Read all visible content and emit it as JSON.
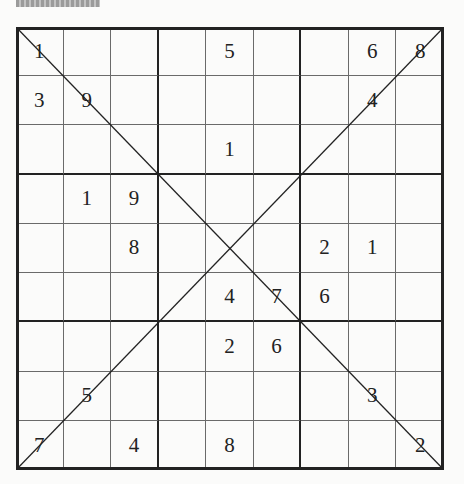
{
  "header": {
    "text": ""
  },
  "puzzle": {
    "type": "diagonal-sudoku",
    "size": 9,
    "grid": [
      [
        "1",
        "",
        "",
        "",
        "5",
        "",
        "",
        "6",
        "8"
      ],
      [
        "3",
        "9",
        "",
        "",
        "",
        "",
        "",
        "4",
        ""
      ],
      [
        "",
        "",
        "",
        "",
        "1",
        "",
        "",
        "",
        ""
      ],
      [
        "",
        "1",
        "9",
        "",
        "",
        "",
        "",
        "",
        ""
      ],
      [
        "",
        "",
        "8",
        "",
        "",
        "",
        "2",
        "1",
        ""
      ],
      [
        "",
        "",
        "",
        "",
        "4",
        "7",
        "6",
        "",
        ""
      ],
      [
        "",
        "",
        "",
        "",
        "2",
        "6",
        "",
        "",
        ""
      ],
      [
        "",
        "5",
        "",
        "",
        "",
        "",
        "",
        "3",
        ""
      ],
      [
        "7",
        "",
        "4",
        "",
        "8",
        "",
        "",
        "",
        "2"
      ]
    ]
  },
  "colors": {
    "line": "#222222",
    "thin_line": "#6a6a6a",
    "digit": "#222222",
    "background": "#fbfbfa"
  }
}
